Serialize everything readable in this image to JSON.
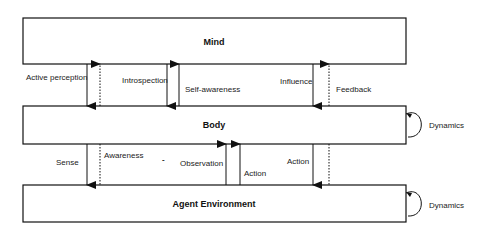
{
  "boxes": {
    "mind": {
      "label": "Mind"
    },
    "body": {
      "label": "Body"
    },
    "environment": {
      "label": "Agent Environment"
    }
  },
  "mind_body_arrows": {
    "active_perception": "Active perception",
    "introspection": "Introspection",
    "self_awareness": "Self-awareness",
    "influence": "Influence",
    "feedback": "Feedback"
  },
  "body_env_arrows": {
    "sense": "Sense",
    "awareness": "Awareness",
    "dash": "-",
    "observation": "Observation",
    "action_up": "Action",
    "action_down": "Action"
  },
  "self_loops": {
    "body_dynamics": "Dynamics",
    "env_dynamics": "Dynamics"
  },
  "colors": {
    "stroke": "#111111",
    "background": "#ffffff"
  }
}
